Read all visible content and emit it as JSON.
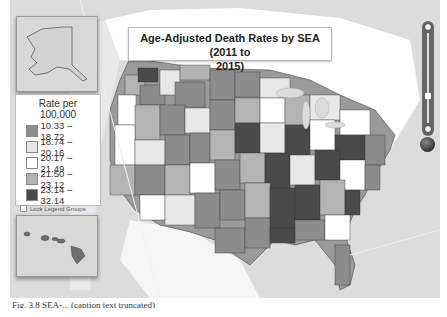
{
  "title": {
    "line1": "Age-Adjusted Death Rates by SEA (2011 to",
    "line2": "2015)"
  },
  "legend": {
    "title": "Rate per 100,000",
    "items": [
      {
        "label": "10.33 – 18.72",
        "color": "#8c8c8c"
      },
      {
        "label": "18.74 – 20.16",
        "color": "#e8e8e8"
      },
      {
        "label": "20.17 – 21.49",
        "color": "#ffffff"
      },
      {
        "label": "21.50 – 23.12",
        "color": "#b4b4b4"
      },
      {
        "label": "23.14 – 32.14",
        "color": "#4a4a4a"
      }
    ],
    "lock_label": "Lock Legend Groups",
    "lock_checked": false
  },
  "insets": {
    "alaska": "Alaska inset",
    "hawaii": "Hawaii inset"
  },
  "controls": {
    "zoom_in": "zoom-in",
    "zoom_out": "zoom-out",
    "globe": "globe-view"
  },
  "caption": "Fig. 3.8 SEA-... (caption text truncated)",
  "colors": {
    "background": "#dcdcdc",
    "canada": "#ffffff",
    "ocean": "#dcdcdc"
  }
}
